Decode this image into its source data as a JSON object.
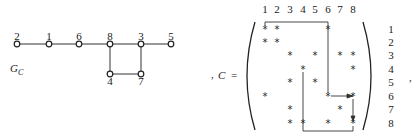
{
  "graph": {
    "label": "G",
    "label_sub": "C",
    "nodes": [
      {
        "id": "2",
        "x": 17,
        "y": 44
      },
      {
        "id": "1",
        "x": 49,
        "y": 44
      },
      {
        "id": "6",
        "x": 79,
        "y": 44
      },
      {
        "id": "8",
        "x": 110,
        "y": 44
      },
      {
        "id": "3",
        "x": 141,
        "y": 44
      },
      {
        "id": "5",
        "x": 171,
        "y": 44
      },
      {
        "id": "4",
        "x": 110,
        "y": 74
      },
      {
        "id": "7",
        "x": 141,
        "y": 74
      }
    ],
    "edges": [
      [
        "2",
        "1"
      ],
      [
        "1",
        "6"
      ],
      [
        "6",
        "8"
      ],
      [
        "8",
        "3"
      ],
      [
        "3",
        "5"
      ],
      [
        "8",
        "4"
      ],
      [
        "4",
        "7"
      ],
      [
        "3",
        "7"
      ]
    ]
  },
  "matrix": {
    "prefix": ",",
    "name": "C",
    "equals": "=",
    "suffix": ",",
    "col_labels": [
      "1",
      "2",
      "3",
      "4",
      "5",
      "6",
      "7",
      "8"
    ],
    "row_labels": [
      "1",
      "2",
      "3",
      "4",
      "5",
      "6",
      "7",
      "8"
    ],
    "star_symbol": "*",
    "rows": [
      [
        1,
        1,
        0,
        0,
        0,
        1,
        0,
        0
      ],
      [
        1,
        1,
        0,
        0,
        0,
        0,
        0,
        0
      ],
      [
        0,
        0,
        1,
        0,
        1,
        0,
        1,
        1
      ],
      [
        0,
        0,
        0,
        1,
        0,
        0,
        0,
        1
      ],
      [
        0,
        0,
        1,
        0,
        1,
        0,
        0,
        0
      ],
      [
        1,
        0,
        0,
        0,
        0,
        1,
        0,
        1
      ],
      [
        0,
        0,
        1,
        0,
        0,
        0,
        1,
        0
      ],
      [
        0,
        0,
        1,
        1,
        0,
        1,
        0,
        1
      ]
    ],
    "path": "top bar cols 1-6, down col 6 to row 6, arrow right to col 8, down col 8 to row 8, bottom bar back to col 4, up col 4 to row 4"
  }
}
